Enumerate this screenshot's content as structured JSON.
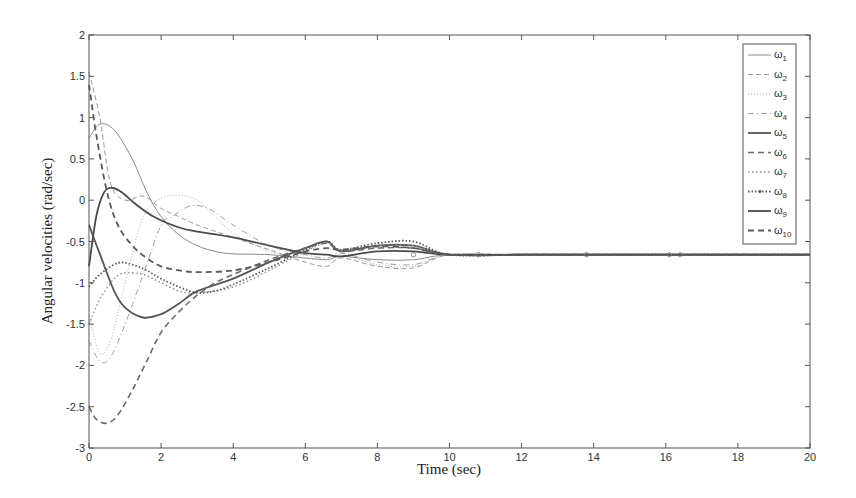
{
  "chart_data": {
    "type": "line",
    "title": "",
    "xlabel": "Time (sec)",
    "ylabel": "Angular velocities (rad/sec)",
    "xlim": [
      0,
      20
    ],
    "ylim": [
      -3,
      2
    ],
    "xticks": [
      0,
      2,
      4,
      6,
      8,
      10,
      12,
      14,
      16,
      18,
      20
    ],
    "yticks": [
      -3,
      -2.5,
      -2,
      -1.5,
      -1,
      -0.5,
      0,
      0.5,
      1,
      1.5,
      2
    ],
    "grid": false,
    "legend_position": "upper right",
    "steady_state_value": -0.66,
    "series": [
      {
        "name": "ω1",
        "style": "solid-thin",
        "color": "#8a8a8a",
        "x": [
          0,
          0.3,
          0.7,
          1.2,
          1.6,
          2.0,
          2.5,
          3.0,
          3.5,
          4.0,
          5.0,
          6.0,
          6.6,
          7.0,
          8.0,
          9.0,
          10,
          12,
          14,
          20
        ],
        "y": [
          0.75,
          0.92,
          0.85,
          0.5,
          0.1,
          -0.2,
          -0.42,
          -0.55,
          -0.62,
          -0.65,
          -0.66,
          -0.7,
          -0.72,
          -0.68,
          -0.72,
          -0.72,
          -0.66,
          -0.66,
          -0.66,
          -0.66
        ]
      },
      {
        "name": "ω2",
        "style": "dashed-thin",
        "color": "#9a9a9a",
        "x": [
          0,
          0.3,
          0.6,
          1.0,
          1.5,
          2.0,
          2.5,
          3.0,
          4.0,
          5.0,
          6.0,
          6.6,
          7.0,
          8.0,
          9.0,
          10,
          12,
          14,
          20
        ],
        "y": [
          1.55,
          1.0,
          0.2,
          0.0,
          0.05,
          -0.1,
          -0.2,
          -0.3,
          -0.45,
          -0.6,
          -0.75,
          -0.8,
          -0.7,
          -0.8,
          -0.82,
          -0.66,
          -0.66,
          -0.66,
          -0.66
        ]
      },
      {
        "name": "ω3",
        "style": "dotted-thin",
        "color": "#b0b0b0",
        "x": [
          0,
          0.3,
          0.6,
          1.0,
          1.5,
          2.0,
          2.5,
          3.0,
          3.5,
          4.0,
          5.0,
          6.0,
          6.6,
          7.0,
          8.0,
          9.0,
          10,
          12,
          14,
          20
        ],
        "y": [
          -1.4,
          -1.85,
          -1.7,
          -1.0,
          -0.2,
          0.02,
          0.06,
          0.0,
          -0.2,
          -0.4,
          -0.62,
          -0.7,
          -0.72,
          -0.66,
          -0.78,
          -0.8,
          -0.66,
          -0.66,
          -0.66,
          -0.66
        ]
      },
      {
        "name": "ω4",
        "style": "dashdot-thin",
        "color": "#a0a0a0",
        "x": [
          0,
          0.3,
          0.6,
          1.0,
          1.5,
          2.0,
          2.3,
          2.8,
          3.3,
          4.0,
          5.0,
          6.0,
          6.6,
          7.0,
          8.0,
          9.0,
          10,
          12,
          14,
          20
        ],
        "y": [
          -1.7,
          -1.95,
          -1.9,
          -1.5,
          -0.9,
          -0.3,
          -0.2,
          -0.07,
          -0.1,
          -0.3,
          -0.55,
          -0.66,
          -0.7,
          -0.64,
          -0.75,
          -0.78,
          -0.66,
          -0.66,
          -0.66,
          -0.66
        ]
      },
      {
        "name": "ω5",
        "style": "solid-thick",
        "color": "#555555",
        "x": [
          0,
          0.3,
          0.7,
          1.0,
          1.5,
          2.0,
          2.5,
          3.0,
          4.0,
          5.0,
          6.0,
          6.6,
          7.0,
          8.0,
          9.0,
          10,
          12,
          14,
          20
        ],
        "y": [
          -0.3,
          -0.65,
          -1.1,
          -1.3,
          -1.42,
          -1.38,
          -1.25,
          -1.1,
          -0.95,
          -0.75,
          -0.58,
          -0.5,
          -0.62,
          -0.55,
          -0.55,
          -0.66,
          -0.66,
          -0.66,
          -0.66
        ]
      },
      {
        "name": "ω6",
        "style": "dashed",
        "color": "#6a6a6a",
        "x": [
          0,
          0.2,
          0.5,
          0.8,
          1.2,
          1.6,
          2.0,
          2.5,
          3.0,
          3.5,
          4.0,
          5.0,
          6.0,
          6.6,
          7.0,
          8.0,
          9.0,
          10,
          12,
          14,
          20
        ],
        "y": [
          -2.5,
          -2.65,
          -2.7,
          -2.6,
          -2.3,
          -1.95,
          -1.6,
          -1.35,
          -1.15,
          -1.0,
          -0.9,
          -0.72,
          -0.58,
          -0.52,
          -0.62,
          -0.58,
          -0.58,
          -0.66,
          -0.66,
          -0.66,
          -0.66
        ]
      },
      {
        "name": "ω7",
        "style": "dotted",
        "color": "#8c8c8c",
        "x": [
          0,
          0.3,
          0.7,
          1.0,
          1.5,
          2.0,
          2.5,
          3.0,
          4.0,
          5.0,
          6.0,
          6.6,
          7.0,
          8.0,
          9.0,
          10,
          12,
          14,
          20
        ],
        "y": [
          -1.5,
          -1.2,
          -0.95,
          -0.88,
          -0.9,
          -1.0,
          -1.1,
          -1.12,
          -1.05,
          -0.85,
          -0.62,
          -0.52,
          -0.6,
          -0.55,
          -0.55,
          -0.66,
          -0.66,
          -0.66,
          -0.66
        ]
      },
      {
        "name": "ω8",
        "style": "dotted-marker",
        "color": "#5a5a5a",
        "x": [
          0,
          0.3,
          0.8,
          1.2,
          1.6,
          2.0,
          2.5,
          3.0,
          3.5,
          4.0,
          5.0,
          6.0,
          6.6,
          7.0,
          8.0,
          9.0,
          10,
          12,
          14,
          20
        ],
        "y": [
          -1.05,
          -0.9,
          -0.76,
          -0.78,
          -0.85,
          -0.95,
          -1.05,
          -1.12,
          -1.1,
          -1.02,
          -0.82,
          -0.6,
          -0.5,
          -0.6,
          -0.52,
          -0.5,
          -0.66,
          -0.66,
          -0.66,
          -0.66
        ]
      },
      {
        "name": "ω9",
        "style": "solid-thick",
        "color": "#4a4a4a",
        "x": [
          0,
          0.2,
          0.4,
          0.6,
          0.9,
          1.3,
          1.8,
          2.5,
          3.0,
          4.0,
          5.0,
          6.0,
          6.6,
          7.0,
          8.0,
          9.0,
          10,
          12,
          14,
          20
        ],
        "y": [
          -0.8,
          -0.2,
          0.08,
          0.15,
          0.1,
          -0.05,
          -0.2,
          -0.33,
          -0.38,
          -0.45,
          -0.55,
          -0.64,
          -0.66,
          -0.68,
          -0.62,
          -0.62,
          -0.66,
          -0.66,
          -0.66,
          -0.66
        ]
      },
      {
        "name": "ω10",
        "style": "dashed-thick",
        "color": "#5a5a5a",
        "x": [
          0,
          0.2,
          0.5,
          0.8,
          1.2,
          1.6,
          2.0,
          2.5,
          3.0,
          4.0,
          5.0,
          6.0,
          6.6,
          7.0,
          8.0,
          9.0,
          10,
          12,
          14,
          20
        ],
        "y": [
          1.4,
          0.8,
          0.1,
          -0.3,
          -0.55,
          -0.7,
          -0.8,
          -0.85,
          -0.87,
          -0.85,
          -0.75,
          -0.62,
          -0.58,
          -0.6,
          -0.56,
          -0.58,
          -0.66,
          -0.66,
          -0.66,
          -0.66
        ]
      }
    ]
  },
  "axes": {
    "xlabel": "Time (sec)",
    "ylabel": "Angular velocities (rad/sec)",
    "xtick_labels": [
      "0",
      "2",
      "4",
      "6",
      "8",
      "10",
      "12",
      "14",
      "16",
      "18",
      "20"
    ],
    "ytick_labels": [
      "-3",
      "-2.5",
      "-2",
      "-1.5",
      "-1",
      "-0.5",
      "0",
      "0.5",
      "1",
      "1.5",
      "2"
    ]
  },
  "legend": {
    "entries": [
      {
        "symbol": "ω",
        "sub": "1"
      },
      {
        "symbol": "ω",
        "sub": "2"
      },
      {
        "symbol": "ω",
        "sub": "3"
      },
      {
        "symbol": "ω",
        "sub": "4"
      },
      {
        "symbol": "ω",
        "sub": "5"
      },
      {
        "symbol": "ω",
        "sub": "6"
      },
      {
        "symbol": "ω",
        "sub": "7"
      },
      {
        "symbol": "ω",
        "sub": "8"
      },
      {
        "symbol": "ω",
        "sub": "9"
      },
      {
        "symbol": "ω",
        "sub": "10"
      }
    ]
  }
}
